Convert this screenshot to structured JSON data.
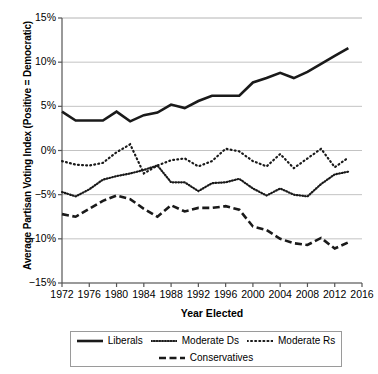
{
  "chart_data": {
    "type": "line",
    "title": "",
    "xlabel": "Year Elected",
    "ylabel": "Average Partisan Voting Index (Positive = Democratic)",
    "xlim": [
      1972,
      2016
    ],
    "ylim": [
      -15,
      15
    ],
    "grid": true,
    "legend_position": "bottom",
    "y_tick_labels": [
      "15%",
      "10%",
      "5%",
      "0%",
      "−5%",
      "−10%",
      "−15%"
    ],
    "y_ticks": [
      15,
      10,
      5,
      0,
      -5,
      -10,
      -15
    ],
    "x_tick_labels": [
      "1972",
      "1976",
      "1980",
      "1984",
      "1988",
      "1992",
      "1996",
      "2000",
      "2004",
      "2008",
      "2012",
      "2016"
    ],
    "x_ticks": [
      1972,
      1976,
      1980,
      1984,
      1988,
      1992,
      1996,
      2000,
      2004,
      2008,
      2012,
      2016
    ],
    "x": [
      1972,
      1974,
      1976,
      1978,
      1980,
      1982,
      1984,
      1986,
      1988,
      1990,
      1992,
      1994,
      1996,
      1998,
      2000,
      2002,
      2004,
      2006,
      2008,
      2010,
      2012,
      2014
    ],
    "series": [
      {
        "name": "Liberals",
        "style": "solid",
        "color": "#1a1a1a",
        "values": [
          4.4,
          3.4,
          3.4,
          3.4,
          4.4,
          3.3,
          4.0,
          4.3,
          5.2,
          4.8,
          5.6,
          6.2,
          6.2,
          6.2,
          7.7,
          8.2,
          8.8,
          8.2,
          8.9,
          9.8,
          10.7,
          11.6
        ]
      },
      {
        "name": "Moderate Ds",
        "style": "dotted-fine",
        "color": "#1a1a1a",
        "values": [
          -4.7,
          -5.2,
          -4.4,
          -3.3,
          -2.9,
          -2.6,
          -2.2,
          -1.7,
          -3.6,
          -3.6,
          -4.6,
          -3.7,
          -3.6,
          -3.2,
          -4.3,
          -5.1,
          -4.3,
          -5.0,
          -5.2,
          -3.8,
          -2.7,
          -2.4
        ]
      },
      {
        "name": "Moderate Rs",
        "style": "dotted-coarse",
        "color": "#1a1a1a",
        "values": [
          -1.2,
          -1.6,
          -1.7,
          -1.4,
          -0.2,
          0.7,
          -2.6,
          -1.7,
          -1.1,
          -0.9,
          -1.8,
          -1.2,
          0.2,
          -0.1,
          -1.2,
          -1.8,
          -0.4,
          -2.0,
          -0.9,
          0.2,
          -1.9,
          -0.8
        ]
      },
      {
        "name": "Conservatives",
        "style": "dashed",
        "color": "#1a1a1a",
        "values": [
          -7.2,
          -7.5,
          -6.6,
          -5.7,
          -5.1,
          -5.5,
          -6.6,
          -7.5,
          -6.2,
          -6.9,
          -6.5,
          -6.5,
          -6.3,
          -6.7,
          -8.6,
          -9.0,
          -10.0,
          -10.5,
          -10.7,
          -9.9,
          -11.1,
          -10.4
        ]
      }
    ]
  },
  "axis": {
    "y_title": "Average Partisan Voting Index (Positive = Democratic)",
    "x_title": "Year Elected"
  },
  "legend": {
    "row1": [
      {
        "label": "Liberals",
        "swatch": "solid-line-swatch"
      },
      {
        "label": "Moderate Ds",
        "swatch": "fine-dotted-line-swatch"
      },
      {
        "label": "Moderate Rs",
        "swatch": "coarse-dotted-line-swatch"
      }
    ],
    "row2": [
      {
        "label": "Conservatives",
        "swatch": "dashed-line-swatch"
      }
    ]
  }
}
